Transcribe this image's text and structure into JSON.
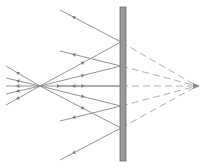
{
  "diagram": {
    "type": "plane-mirror-reflection",
    "colors": {
      "ray": "#888888",
      "virtual_ray": "#999999",
      "mirror_fill": "#9a9a9a",
      "mirror_stroke": "#6e6e6e",
      "background": "#ffffff"
    },
    "mirror": {
      "x": 120,
      "y": 7,
      "width": 6,
      "height": 154
    },
    "source": {
      "x": 40,
      "y": 86
    },
    "image": {
      "x": 197,
      "y": 86
    },
    "reflection_points": [
      {
        "x": 121,
        "y": 42,
        "reflected_end": {
          "x": 60,
          "y": 10
        }
      },
      {
        "x": 121,
        "y": 66,
        "reflected_end": {
          "x": 60,
          "y": 51
        }
      },
      {
        "x": 121,
        "y": 86,
        "reflected_end": {
          "x": 60,
          "y": 86
        }
      },
      {
        "x": 121,
        "y": 106,
        "reflected_end": {
          "x": 60,
          "y": 121
        }
      },
      {
        "x": 121,
        "y": 128,
        "reflected_end": {
          "x": 60,
          "y": 160
        }
      }
    ],
    "source_back_rays": [
      {
        "x": 6,
        "y": 66
      },
      {
        "x": 6,
        "y": 78
      },
      {
        "x": 6,
        "y": 86
      },
      {
        "x": 6,
        "y": 94
      },
      {
        "x": 6,
        "y": 105
      }
    ]
  }
}
